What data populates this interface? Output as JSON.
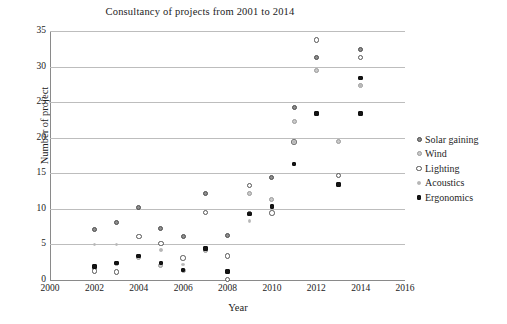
{
  "chart_data": {
    "type": "scatter",
    "title": "Consultancy of projects from 2001 to 2014",
    "xlabel": "Year",
    "ylabel": "Number of project",
    "xlim": [
      2000,
      2016
    ],
    "ylim": [
      0,
      35
    ],
    "xticks": [
      2000,
      2002,
      2004,
      2006,
      2008,
      2010,
      2012,
      2014,
      2016
    ],
    "yticks": [
      0,
      5,
      10,
      15,
      20,
      25,
      30,
      35
    ],
    "grid": "horizontal",
    "legend_position": "right",
    "series": [
      {
        "name": "Solar gaining",
        "marker": "filled-grey-circle",
        "color": "#8e8e8e",
        "points": [
          {
            "x": 2002,
            "y": 7.1
          },
          {
            "x": 2003,
            "y": 8.1
          },
          {
            "x": 2004,
            "y": 10.2
          },
          {
            "x": 2005,
            "y": 7.2
          },
          {
            "x": 2006,
            "y": 6.1
          },
          {
            "x": 2007,
            "y": 12.2
          },
          {
            "x": 2008,
            "y": 6.2
          },
          {
            "x": 2009,
            "y": 9.3
          },
          {
            "x": 2010,
            "y": 14.4
          },
          {
            "x": 2011,
            "y": 24.3
          },
          {
            "x": 2012,
            "y": 31.3
          },
          {
            "x": 2014,
            "y": 32.4
          }
        ]
      },
      {
        "name": "Wind",
        "marker": "light-grey-circle",
        "color": "#c9c9c9",
        "points": [
          {
            "x": 2002,
            "y": 1.7
          },
          {
            "x": 2003,
            "y": 2.3
          },
          {
            "x": 2004,
            "y": 3.1
          },
          {
            "x": 2005,
            "y": 2.1
          },
          {
            "x": 2006,
            "y": 1.3
          },
          {
            "x": 2007,
            "y": 4.2
          },
          {
            "x": 2009,
            "y": 12.2
          },
          {
            "x": 2010,
            "y": 11.3
          },
          {
            "x": 2011,
            "y": 22.3
          },
          {
            "x": 2012,
            "y": 29.5
          },
          {
            "x": 2013,
            "y": 19.4
          },
          {
            "x": 2014,
            "y": 27.3
          }
        ]
      },
      {
        "name": "Lighting",
        "marker": "open-circle",
        "color": "#ffffff",
        "points": [
          {
            "x": 2002,
            "y": 1.3
          },
          {
            "x": 2003,
            "y": 1.1
          },
          {
            "x": 2004,
            "y": 6.1
          },
          {
            "x": 2005,
            "y": 5.1
          },
          {
            "x": 2006,
            "y": 3.1
          },
          {
            "x": 2007,
            "y": 9.5
          },
          {
            "x": 2008,
            "y": 3.4
          },
          {
            "x": 2008,
            "y": 0.1
          },
          {
            "x": 2009,
            "y": 13.3
          },
          {
            "x": 2010,
            "y": 9.4
          },
          {
            "x": 2011,
            "y": 19.4
          },
          {
            "x": 2012,
            "y": 33.7
          },
          {
            "x": 2013,
            "y": 14.7
          },
          {
            "x": 2014,
            "y": 31.3
          }
        ]
      },
      {
        "name": "Acoustics",
        "marker": "small-grey-dot",
        "color": "#b6b6b6",
        "points": [
          {
            "x": 2002,
            "y": 5.0
          },
          {
            "x": 2003,
            "y": 5.0
          },
          {
            "x": 2004,
            "y": 3.4
          },
          {
            "x": 2005,
            "y": 4.2
          },
          {
            "x": 2006,
            "y": 2.2
          },
          {
            "x": 2007,
            "y": 4.4
          },
          {
            "x": 2009,
            "y": 8.3
          },
          {
            "x": 2010,
            "y": 10.3
          },
          {
            "x": 2011,
            "y": 19.4
          },
          {
            "x": 2014,
            "y": 27.3
          }
        ]
      },
      {
        "name": "Ergonomics",
        "marker": "filled-black-square",
        "color": "#141414",
        "points": [
          {
            "x": 2002,
            "y": 1.9
          },
          {
            "x": 2003,
            "y": 2.4
          },
          {
            "x": 2004,
            "y": 3.4
          },
          {
            "x": 2005,
            "y": 2.4
          },
          {
            "x": 2006,
            "y": 1.4
          },
          {
            "x": 2007,
            "y": 4.4
          },
          {
            "x": 2008,
            "y": 1.2
          },
          {
            "x": 2009,
            "y": 9.3
          },
          {
            "x": 2010,
            "y": 10.3
          },
          {
            "x": 2011,
            "y": 16.3
          },
          {
            "x": 2012,
            "y": 23.4
          },
          {
            "x": 2013,
            "y": 13.4
          },
          {
            "x": 2014,
            "y": 23.4
          },
          {
            "x": 2014,
            "y": 28.4
          }
        ]
      }
    ]
  },
  "axes": {
    "ylabels": [
      "0",
      "5",
      "10",
      "15",
      "20",
      "25",
      "30",
      "35"
    ],
    "xlabels": [
      "2000",
      "2002",
      "2004",
      "2006",
      "2008",
      "2010",
      "2012",
      "2014",
      "2016"
    ]
  },
  "legend": {
    "items": [
      {
        "label": "Solar gaining",
        "marker_class": "m-solar",
        "icon": "grey-filled-circle-marker-icon"
      },
      {
        "label": "Wind",
        "marker_class": "m-wind",
        "icon": "light-grey-circle-marker-icon"
      },
      {
        "label": "Lighting",
        "marker_class": "m-light",
        "icon": "open-circle-marker-icon"
      },
      {
        "label": "Acoustics",
        "marker_class": "m-acou",
        "icon": "small-grey-dot-marker-icon"
      },
      {
        "label": "Ergonomics",
        "marker_class": "m-ergo",
        "icon": "black-square-marker-icon"
      }
    ]
  }
}
